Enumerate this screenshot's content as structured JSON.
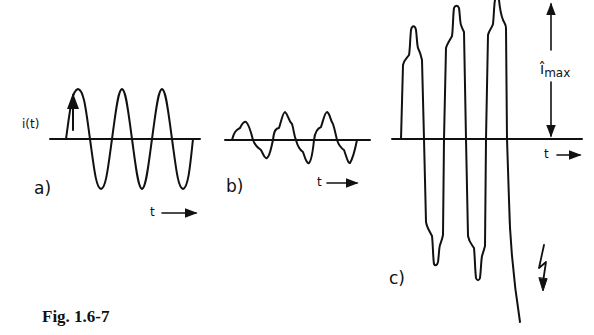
{
  "figure": {
    "caption": "Fig. 1.6-7",
    "panels": [
      {
        "id": "a",
        "label": "a)",
        "y_axis_label": "i(t)",
        "x_axis_label": "t",
        "description": "pure sinusoidal current, constant amplitude"
      },
      {
        "id": "b",
        "label": "b)",
        "x_axis_label": "t",
        "description": "distorted (harmonic-rich) periodic current, small amplitude"
      },
      {
        "id": "c",
        "label": "c)",
        "x_axis_label": "t",
        "peak_label": "î",
        "peak_label_sub": "max",
        "description": "growing oscillating current with rising peaks, ending in breakdown (lightning symbol)"
      }
    ],
    "colors": {
      "stroke": "#111111",
      "background": "#ffffff"
    }
  }
}
